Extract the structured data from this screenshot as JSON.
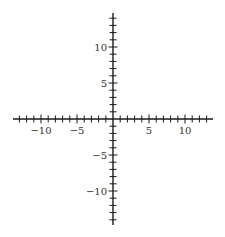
{
  "chart_data": {
    "type": "scatter",
    "title": "",
    "xlabel": "",
    "ylabel": "",
    "xlim": [
      -14,
      14
    ],
    "ylim": [
      -14.5,
      14.5
    ],
    "grid": false,
    "axes_style": "cartesian-crossing-at-origin",
    "tick_step": 1,
    "labeled_ticks": {
      "x": [
        {
          "value": -10,
          "label": "−10"
        },
        {
          "value": -5,
          "label": "−5"
        },
        {
          "value": 5,
          "label": "5"
        },
        {
          "value": 10,
          "label": "10"
        }
      ],
      "y": [
        {
          "value": 10,
          "label": "10"
        },
        {
          "value": 5,
          "label": "5"
        },
        {
          "value": -5,
          "label": "−5"
        },
        {
          "value": -10,
          "label": "−10"
        }
      ]
    },
    "series": []
  },
  "colors": {
    "axis": "#1a1a1a",
    "label": "#333333",
    "background": "#ffffff"
  },
  "layout": {
    "origin_px": [
      113,
      119
    ],
    "unit_px": 7.2,
    "x_axis_px": [
      13,
      213
    ],
    "y_axis_px": [
      13,
      225
    ]
  }
}
